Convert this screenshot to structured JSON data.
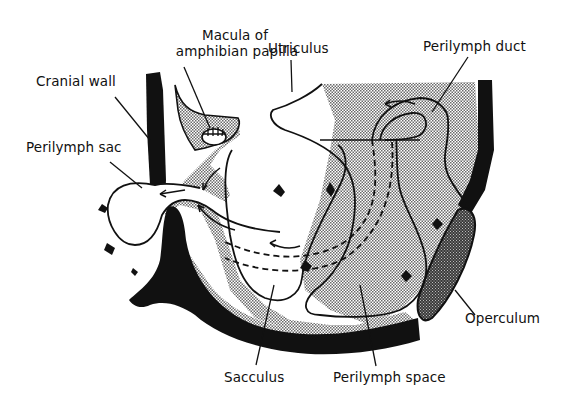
{
  "figure": {
    "type": "anatomical-diagram"
  },
  "labels": {
    "macula_line1": "Macula of",
    "macula_line2": "amphibian papilla",
    "utriculus": "Utriculus",
    "perilymph_duct": "Perilymph duct",
    "cranial_wall": "Cranial wall",
    "perilymph_sac": "Perilymph sac",
    "operculum": "Operculum",
    "sacculus": "Sacculus",
    "perilymph_space": "Perilymph space"
  },
  "colors": {
    "ink": "#111111",
    "stipple": "#cfcfcf",
    "operculum_fill": "#555555",
    "background": "#ffffff"
  }
}
